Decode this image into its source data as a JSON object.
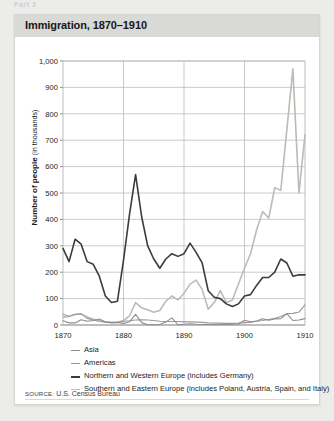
{
  "page": {
    "cutoff_text": "Part 3"
  },
  "card": {
    "title": "Immigration, 1870–1910",
    "source_prefix": "SOURCE:",
    "source_text": "U.S. Census Bureau"
  },
  "chart_data": {
    "type": "line",
    "title": "Immigration, 1870–1910",
    "xlabel": "",
    "ylabel": "Number of people (in thousands)",
    "ylabel_main": "Number of people",
    "ylabel_sub": "(in thousands)",
    "xlim": [
      1870,
      1910
    ],
    "ylim": [
      0,
      1000
    ],
    "yticks": [
      0,
      100,
      200,
      300,
      400,
      500,
      600,
      700,
      800,
      900,
      1000
    ],
    "ytick_labels": [
      "0",
      "100",
      "200",
      "300",
      "400",
      "500",
      "600",
      "700",
      "800",
      "900",
      "1,000"
    ],
    "xticks": [
      1870,
      1880,
      1890,
      1900,
      1910
    ],
    "xtick_labels": [
      "1870",
      "1880",
      "1890",
      "1900",
      "1910"
    ],
    "grid": "both",
    "legend_position": "below",
    "x": [
      1870,
      1871,
      1872,
      1873,
      1874,
      1875,
      1876,
      1877,
      1878,
      1879,
      1880,
      1881,
      1882,
      1883,
      1884,
      1885,
      1886,
      1887,
      1888,
      1889,
      1890,
      1891,
      1892,
      1893,
      1894,
      1895,
      1896,
      1897,
      1898,
      1899,
      1900,
      1901,
      1902,
      1903,
      1904,
      1905,
      1906,
      1907,
      1908,
      1909,
      1910
    ],
    "series": [
      {
        "name": "Asia",
        "color": "#8d8d92",
        "width": 1.1,
        "values": [
          16,
          8,
          8,
          20,
          14,
          17,
          23,
          11,
          9,
          10,
          6,
          12,
          40,
          9,
          1,
          1,
          2,
          11,
          27,
          1,
          3,
          5,
          3,
          2,
          2,
          1,
          3,
          2,
          3,
          4,
          18,
          12,
          15,
          24,
          18,
          23,
          24,
          43,
          17,
          19,
          24
        ]
      },
      {
        "name": "Americas",
        "color": "#9a9a9e",
        "width": 1.1,
        "values": [
          41,
          33,
          41,
          42,
          25,
          19,
          13,
          11,
          10,
          10,
          14,
          16,
          19,
          20,
          19,
          17,
          14,
          13,
          13,
          13,
          12,
          12,
          11,
          10,
          8,
          7,
          7,
          6,
          6,
          7,
          9,
          11,
          14,
          17,
          21,
          25,
          32,
          43,
          44,
          49,
          76
        ]
      },
      {
        "name": "Northern and Western Europe (includes Germany)",
        "color": "#3b3b40",
        "width": 1.6,
        "values": [
          290,
          240,
          325,
          306,
          240,
          230,
          185,
          110,
          85,
          90,
          245,
          420,
          570,
          410,
          300,
          250,
          215,
          250,
          270,
          260,
          270,
          310,
          275,
          235,
          130,
          105,
          100,
          80,
          70,
          80,
          110,
          115,
          150,
          180,
          180,
          200,
          250,
          235,
          185,
          190,
          190
        ]
      },
      {
        "name": "Southern and Eastern Europe (includes Poland, Austria, Spain, and Italy)",
        "color": "#b9bdb4",
        "width": 1.6,
        "values": [
          30,
          32,
          40,
          42,
          30,
          22,
          17,
          12,
          9,
          10,
          17,
          35,
          85,
          65,
          58,
          48,
          55,
          90,
          110,
          95,
          120,
          155,
          170,
          135,
          60,
          85,
          130,
          85,
          95,
          155,
          215,
          270,
          360,
          430,
          405,
          520,
          510,
          740,
          970,
          500,
          720
        ]
      }
    ],
    "legend": [
      {
        "label": "Asia",
        "color": "#8d8d92",
        "thickness": 1.3
      },
      {
        "label": "Americas",
        "color": "#9a9a9e",
        "thickness": 1.3
      },
      {
        "label": "Northern and Western Europe (includes Germany)",
        "color": "#3b3b40",
        "thickness": 2.1
      },
      {
        "label": "Southern and Eastern Europe (includes Poland, Austria, Spain, and Italy)",
        "color": "#b9bdb4",
        "thickness": 1.6
      }
    ]
  },
  "colors": {
    "title_bar": "#d9d9d6",
    "card_bg": "#ffffff",
    "page_bg": "#ececea",
    "grid": "#b6b6b6",
    "axis": "#6d6d6d"
  }
}
